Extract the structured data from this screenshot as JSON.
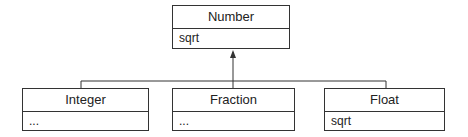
{
  "diagram": {
    "type": "uml-class-hierarchy",
    "parent": {
      "name": "Number",
      "members": "sqrt"
    },
    "children": [
      {
        "name": "Integer",
        "members": "..."
      },
      {
        "name": "Fraction",
        "members": "..."
      },
      {
        "name": "Float",
        "members": "sqrt"
      }
    ],
    "relation": "inheritance"
  }
}
